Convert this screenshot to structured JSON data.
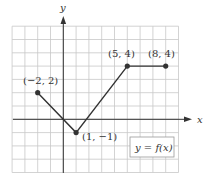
{
  "chart_data": {
    "type": "line",
    "title": "",
    "xlabel": "x",
    "ylabel": "y",
    "xlim": [
      -4,
      9
    ],
    "ylim": [
      -4,
      7
    ],
    "grid": true,
    "series": [
      {
        "name": "y = f(x)",
        "points": [
          {
            "x": -2,
            "y": 2,
            "label": "(−2, 2)"
          },
          {
            "x": 1,
            "y": -1,
            "label": "(1, −1)"
          },
          {
            "x": 5,
            "y": 4,
            "label": "(5, 4)"
          },
          {
            "x": 8,
            "y": 4,
            "label": "(8, 4)"
          }
        ]
      }
    ],
    "legend": {
      "text": "y = f(x)",
      "position": "lower right"
    }
  },
  "labels": {
    "x_axis": "x",
    "y_axis": "y",
    "p1": "(−2, 2)",
    "p2": "(1, −1)",
    "p3": "(5, 4)",
    "p4": "(8, 4)",
    "func": "y = f(x)"
  },
  "colors": {
    "grid": "#c8c8c8",
    "axis": "#333333",
    "line": "#333333"
  }
}
